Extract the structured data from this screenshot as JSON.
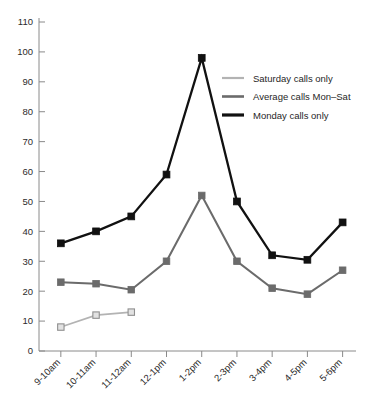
{
  "chart_data": {
    "type": "line",
    "title": "",
    "xlabel": "",
    "ylabel": "",
    "categories": [
      "9-10am",
      "10-11am",
      "11-12am",
      "12-1pm",
      "1-2pm",
      "2-3pm",
      "3-4pm",
      "4-5pm",
      "5-6pm"
    ],
    "ylim": [
      0,
      110
    ],
    "yticks": [
      0,
      10,
      20,
      30,
      40,
      50,
      60,
      70,
      80,
      90,
      100,
      110
    ],
    "grid": false,
    "legend_position": "upper-right",
    "series": [
      {
        "name": "Saturday calls only",
        "color": "#b3b3b3",
        "marker": "square-open",
        "values": [
          8,
          12,
          13,
          null,
          null,
          null,
          null,
          null,
          null
        ]
      },
      {
        "name": "Average calls Mon-Sat",
        "color": "#6b6b6b",
        "marker": "square",
        "values": [
          23,
          22.5,
          20.5,
          30,
          52,
          30,
          21,
          19,
          27
        ]
      },
      {
        "name": "Monday calls only",
        "color": "#111111",
        "marker": "square",
        "values": [
          36,
          40,
          45,
          59,
          98,
          50,
          32,
          30.5,
          43
        ]
      }
    ]
  },
  "axes": {
    "y_labels": [
      "110",
      "100",
      "90",
      "80",
      "70",
      "60",
      "50",
      "40",
      "30",
      "20",
      "10",
      "0"
    ],
    "x_labels": [
      "9-10am",
      "10-11am",
      "11-12am",
      "12-1pm",
      "1-2pm",
      "2-3pm",
      "3-4pm",
      "4-5pm",
      "5-6pm"
    ]
  },
  "legend": {
    "entries": [
      {
        "label": "Saturday calls only",
        "color": "#b3b3b3",
        "width": 2.2
      },
      {
        "label": "Average calls Mon–Sat",
        "color": "#6b6b6b",
        "width": 2.6
      },
      {
        "label": "Monday calls only",
        "color": "#111111",
        "width": 3.2
      }
    ]
  }
}
